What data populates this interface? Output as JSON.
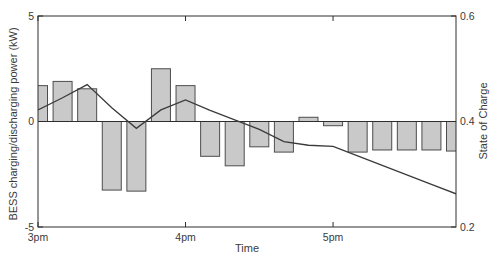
{
  "chart_data": {
    "type": "combo-bar-line",
    "title": "",
    "xlabel": "Time",
    "grid": "off",
    "legend": "none",
    "x_axis": {
      "range_hours": [
        15.0,
        17.8333
      ],
      "ticks": [
        {
          "label": "3pm",
          "t": 15.0
        },
        {
          "label": "4pm",
          "t": 16.0
        },
        {
          "label": "5pm",
          "t": 17.0
        }
      ]
    },
    "left_axis": {
      "label": "BESS charging/discharging power (kW)",
      "range": [
        -5,
        5
      ],
      "ticks": [
        {
          "label": "5",
          "v": 5
        },
        {
          "label": "0",
          "v": 0
        },
        {
          "label": "-5",
          "v": -5
        }
      ]
    },
    "right_axis": {
      "label": "State of Charge",
      "range": [
        0.2,
        0.6
      ],
      "ticks": [
        {
          "label": "0.6",
          "v": 0.6
        },
        {
          "label": "0.4",
          "v": 0.4
        },
        {
          "label": "0.2",
          "v": 0.2
        }
      ]
    },
    "bars_kw": {
      "name": "BESS charging/discharging power",
      "unit": "kW",
      "interval_minutes": 10,
      "points": [
        {
          "time": "3:00pm",
          "t": 15.0,
          "kw": 1.7
        },
        {
          "time": "3:10pm",
          "t": 15.1667,
          "kw": 1.9
        },
        {
          "time": "3:20pm",
          "t": 15.3333,
          "kw": 1.55
        },
        {
          "time": "3:30pm",
          "t": 15.5,
          "kw": -3.25
        },
        {
          "time": "3:40pm",
          "t": 15.6667,
          "kw": -3.3
        },
        {
          "time": "3:50pm",
          "t": 15.8333,
          "kw": 2.5
        },
        {
          "time": "4:00pm",
          "t": 16.0,
          "kw": 1.7
        },
        {
          "time": "4:10pm",
          "t": 16.1667,
          "kw": -1.65
        },
        {
          "time": "4:20pm",
          "t": 16.3333,
          "kw": -2.1
        },
        {
          "time": "4:30pm",
          "t": 16.5,
          "kw": -1.2
        },
        {
          "time": "4:40pm",
          "t": 16.6667,
          "kw": -1.45
        },
        {
          "time": "4:50pm",
          "t": 16.8333,
          "kw": 0.2
        },
        {
          "time": "5:00pm",
          "t": 17.0,
          "kw": -0.2
        },
        {
          "time": "5:10pm",
          "t": 17.1667,
          "kw": -1.45
        },
        {
          "time": "5:20pm",
          "t": 17.3333,
          "kw": -1.35
        },
        {
          "time": "5:30pm",
          "t": 17.5,
          "kw": -1.35
        },
        {
          "time": "5:40pm",
          "t": 17.6667,
          "kw": -1.35
        },
        {
          "time": "5:50pm",
          "t": 17.8333,
          "kw": -1.4
        }
      ]
    },
    "soc_line": {
      "name": "State of Charge",
      "points": [
        {
          "time": "3:00pm",
          "t": 15.0,
          "soc": 0.422
        },
        {
          "time": "3:10pm",
          "t": 15.1667,
          "soc": 0.445
        },
        {
          "time": "3:20pm",
          "t": 15.3333,
          "soc": 0.47
        },
        {
          "time": "3:30pm",
          "t": 15.5,
          "soc": 0.426
        },
        {
          "time": "3:40pm",
          "t": 15.6667,
          "soc": 0.387
        },
        {
          "time": "3:50pm",
          "t": 15.8333,
          "soc": 0.422
        },
        {
          "time": "4:00pm",
          "t": 16.0,
          "soc": 0.441
        },
        {
          "time": "4:10pm",
          "t": 16.1667,
          "soc": 0.421
        },
        {
          "time": "4:20pm",
          "t": 16.3333,
          "soc": 0.403
        },
        {
          "time": "4:30pm",
          "t": 16.5,
          "soc": 0.385
        },
        {
          "time": "4:40pm",
          "t": 16.6667,
          "soc": 0.362
        },
        {
          "time": "4:50pm",
          "t": 16.8333,
          "soc": 0.355
        },
        {
          "time": "5:00pm",
          "t": 17.0,
          "soc": 0.353
        },
        {
          "time": "5:10pm",
          "t": 17.1667,
          "soc": 0.335
        },
        {
          "time": "5:20pm",
          "t": 17.3333,
          "soc": 0.317
        },
        {
          "time": "5:30pm",
          "t": 17.5,
          "soc": 0.299
        },
        {
          "time": "5:40pm",
          "t": 17.6667,
          "soc": 0.281
        },
        {
          "time": "5:50pm",
          "t": 17.8333,
          "soc": 0.263
        }
      ]
    },
    "colors": {
      "background": "#ffffff",
      "bar_fill": "#c9c9c9",
      "bar_edge": "#4d4d4d",
      "soc_line": "#3b3b3b",
      "axis": "#2e2e2e",
      "text": "#3a3a3a"
    }
  }
}
